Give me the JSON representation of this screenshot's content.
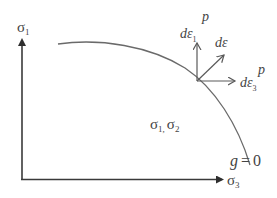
{
  "diagram": {
    "type": "yield-surface-flow-rule",
    "axes": {
      "vertical": {
        "label": "σ",
        "subscript": "1"
      },
      "horizontal": {
        "label": "σ",
        "subscript": "3"
      }
    },
    "curve": {
      "label_lhs": "g",
      "label_eq": "=",
      "label_rhs": "0"
    },
    "region_label": {
      "a": "σ",
      "a_sub": "1,",
      "b": "σ",
      "b_sub": "2"
    },
    "vectors": {
      "vertical": {
        "label": "dε",
        "subscript": "1",
        "superscript": "p"
      },
      "diagonal": {
        "label": "dε"
      },
      "horizontal": {
        "label": "dε",
        "subscript": "3",
        "superscript": "p"
      }
    },
    "colors": {
      "axis": "#3a3a3a",
      "curve": "#6a6a6a",
      "vector": "#5a5a5a",
      "text": "#444444"
    }
  }
}
